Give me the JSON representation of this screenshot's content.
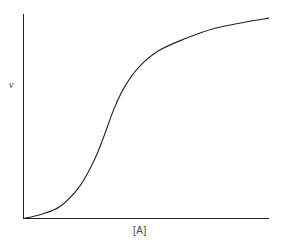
{
  "chart_data": {
    "type": "line",
    "title": "",
    "xlabel": "[A]",
    "ylabel": "v",
    "grid": false,
    "legend": null,
    "x_ticks": [],
    "y_ticks": [],
    "series": [
      {
        "name": "v",
        "x": [
          0,
          0.07,
          0.15,
          0.23,
          0.29,
          0.33,
          0.37,
          0.41,
          0.47,
          0.55,
          0.66,
          0.78,
          0.9,
          1.0
        ],
        "y": [
          0,
          0.02,
          0.06,
          0.16,
          0.29,
          0.41,
          0.54,
          0.64,
          0.74,
          0.82,
          0.88,
          0.93,
          0.96,
          0.98
        ]
      }
    ]
  },
  "labels": {
    "y_axis": "v",
    "x_axis": "[A]"
  }
}
